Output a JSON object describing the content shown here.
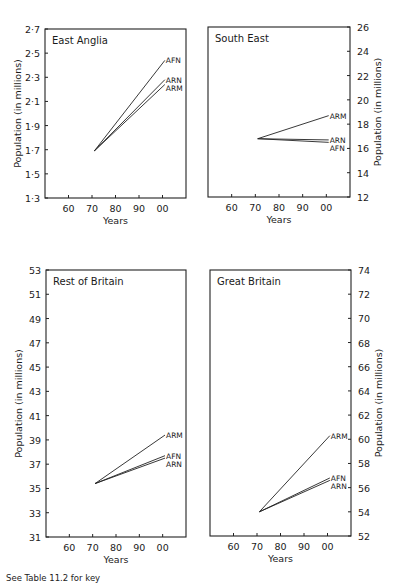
{
  "footnote": "See Table 11.2 for key",
  "chart_data": [
    {
      "type": "line",
      "title": "East Anglia",
      "xlabel": "Years",
      "ylabel": "Population (in millions)",
      "yaxis_side": "left",
      "x_ticks": [
        "60",
        "70",
        "80",
        "90",
        "00"
      ],
      "x_tick_years": [
        1960,
        1970,
        1980,
        1990,
        2000
      ],
      "xlim": [
        1950,
        2010
      ],
      "y_ticks": [
        "1·3",
        "1·5",
        "1·7",
        "1·9",
        "2·1",
        "2·3",
        "2·5",
        "2·7"
      ],
      "y_tick_values": [
        1.3,
        1.5,
        1.7,
        1.9,
        2.1,
        2.3,
        2.5,
        2.7
      ],
      "ylim": [
        1.3,
        2.7
      ],
      "x": [
        1971,
        2001
      ],
      "series": [
        {
          "name": "AFN",
          "values": [
            1.69,
            2.44
          ]
        },
        {
          "name": "ARN",
          "values": [
            1.69,
            2.28
          ]
        },
        {
          "name": "ARM",
          "values": [
            1.69,
            2.24
          ]
        }
      ],
      "grid": false
    },
    {
      "type": "line",
      "title": "South East",
      "xlabel": "Years",
      "ylabel": "Population (in millions)",
      "yaxis_side": "right",
      "x_ticks": [
        "60",
        "70",
        "80",
        "90",
        "00"
      ],
      "x_tick_years": [
        1960,
        1970,
        1980,
        1990,
        2000
      ],
      "xlim": [
        1950,
        2010
      ],
      "y_ticks": [
        "12",
        "14",
        "16",
        "18",
        "20",
        "22",
        "24",
        "26"
      ],
      "y_tick_values": [
        12,
        14,
        16,
        18,
        20,
        22,
        24,
        26
      ],
      "ylim": [
        12,
        26
      ],
      "x": [
        1971,
        2001
      ],
      "series": [
        {
          "name": "ARM",
          "values": [
            16.8,
            18.7
          ]
        },
        {
          "name": "ARN",
          "values": [
            16.8,
            16.7
          ]
        },
        {
          "name": "AFN",
          "values": [
            16.8,
            16.5
          ]
        }
      ],
      "grid": false
    },
    {
      "type": "line",
      "title": "Rest of Britain",
      "xlabel": "Years",
      "ylabel": "Population (in millions)",
      "yaxis_side": "left",
      "x_ticks": [
        "60",
        "70",
        "80",
        "90",
        "00"
      ],
      "x_tick_years": [
        1960,
        1970,
        1980,
        1990,
        2000
      ],
      "xlim": [
        1950,
        2010
      ],
      "y_ticks": [
        "31",
        "33",
        "35",
        "37",
        "39",
        "41",
        "43",
        "45",
        "47",
        "49",
        "51",
        "53"
      ],
      "y_tick_values": [
        31,
        33,
        35,
        37,
        39,
        41,
        43,
        45,
        47,
        49,
        51,
        53
      ],
      "ylim": [
        31,
        53
      ],
      "x": [
        1971,
        2001
      ],
      "series": [
        {
          "name": "ARM",
          "values": [
            35.4,
            39.4
          ]
        },
        {
          "name": "AFN",
          "values": [
            35.4,
            37.7
          ]
        },
        {
          "name": "ARN",
          "values": [
            35.4,
            37.5
          ]
        }
      ],
      "grid": false
    },
    {
      "type": "line",
      "title": "Great Britain",
      "xlabel": "Years",
      "ylabel": "Population (in millions)",
      "yaxis_side": "right",
      "x_ticks": [
        "60",
        "70",
        "80",
        "90",
        "00"
      ],
      "x_tick_years": [
        1960,
        1970,
        1980,
        1990,
        2000
      ],
      "xlim": [
        1950,
        2010
      ],
      "y_ticks": [
        "52",
        "54",
        "56",
        "58",
        "60",
        "62",
        "64",
        "66",
        "68",
        "70",
        "72",
        "74"
      ],
      "y_tick_values": [
        52,
        54,
        56,
        58,
        60,
        62,
        64,
        66,
        68,
        70,
        72,
        74
      ],
      "ylim": [
        52,
        74
      ],
      "x": [
        1971,
        2001
      ],
      "series": [
        {
          "name": "ARM",
          "values": [
            54.0,
            60.3
          ]
        },
        {
          "name": "AFN",
          "values": [
            54.0,
            56.8
          ]
        },
        {
          "name": "ARN",
          "values": [
            54.0,
            56.6
          ]
        }
      ],
      "grid": false
    }
  ],
  "layout": {
    "panels": [
      {
        "left": 45,
        "top": 29,
        "right": 186,
        "bottom": 198
      },
      {
        "left": 208,
        "top": 27,
        "right": 350,
        "bottom": 197
      },
      {
        "left": 46,
        "top": 270,
        "right": 186,
        "bottom": 537
      },
      {
        "left": 210,
        "top": 270,
        "right": 351,
        "bottom": 536
      }
    ]
  }
}
